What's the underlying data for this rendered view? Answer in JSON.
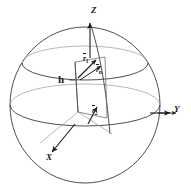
{
  "figure": {
    "name": "spherical-coordinate-sphere-diagram",
    "background_color": "#ffffff",
    "line_color": "#2b2b2b",
    "faint_line_color": "#8a8a8a",
    "text_color": "#1a1a1a"
  },
  "axes": [
    {
      "id": "z",
      "label": "Z",
      "label_x": 93,
      "label_y": 12,
      "direction": "up",
      "arrow": "single"
    },
    {
      "id": "y",
      "label": "Y",
      "label_x": 176,
      "label_y": 110,
      "direction": "right",
      "arrow": "double"
    },
    {
      "id": "x",
      "label": "X",
      "label_x": 48,
      "label_y": 160,
      "direction": "down-left",
      "arrow": "single"
    }
  ],
  "sphere": {
    "center_x": 85,
    "center_y": 105,
    "radius_x": 75,
    "radius_y": 78
  },
  "circles": [
    {
      "id": "latitude-circle",
      "cx": 85,
      "cy": 63,
      "rx": 63,
      "ry": 17
    },
    {
      "id": "equator-circle",
      "cx": 85,
      "cy": 105,
      "rx": 75,
      "ry": 21
    }
  ],
  "labels": [
    {
      "id": "height-label",
      "text": "h",
      "x": 62,
      "y": 79,
      "kind": "scalar"
    },
    {
      "id": "vector-r-upper-label",
      "text": "r",
      "sub": "1",
      "x": 84,
      "y": 58,
      "kind": "vector"
    },
    {
      "id": "vector-r-mid-label",
      "text": "r",
      "sub": "n",
      "x": 96,
      "y": 68,
      "kind": "vector"
    },
    {
      "id": "vector-r-lower-label",
      "text": "r",
      "sub": "2",
      "x": 93,
      "y": 110,
      "kind": "vector"
    }
  ],
  "panel": {
    "id": "inner-quadrilateral-panel",
    "points": "75,62 105,57 107,118 78,112"
  }
}
